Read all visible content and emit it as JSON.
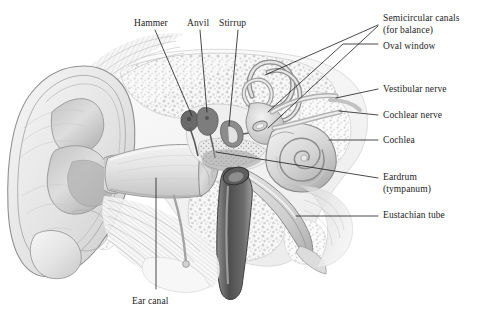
{
  "figure": {
    "background_color": "#ffffff",
    "line_color": "#1c1c1c",
    "text_color": "#1c1c1c",
    "ink_tones": {
      "outline": "#6e6e6e",
      "mid_gray": "#b9b9b9",
      "light_gray": "#dcdcdc",
      "very_light": "#f0f0f0",
      "dark_gray": "#555555",
      "darkest": "#3a3a3a"
    }
  },
  "labels": {
    "top": [
      {
        "id": "hammer",
        "text": "Hammer",
        "x": 134,
        "y": 18
      },
      {
        "id": "anvil",
        "text": "Anvil",
        "x": 187,
        "y": 18
      },
      {
        "id": "stirrup",
        "text": "Stirrup",
        "x": 219,
        "y": 18
      }
    ],
    "right": [
      {
        "id": "semicircular-canals",
        "text": "Semicircular canals\n(for balance)",
        "x": 383,
        "y": 13
      },
      {
        "id": "oval-window",
        "text": "Oval window",
        "x": 383,
        "y": 41
      },
      {
        "id": "vestibular-nerve",
        "text": "Vestibular nerve",
        "x": 383,
        "y": 84
      },
      {
        "id": "cochlear-nerve",
        "text": "Cochlear nerve",
        "x": 383,
        "y": 110
      },
      {
        "id": "cochlea",
        "text": "Cochlea",
        "x": 383,
        "y": 135
      },
      {
        "id": "eardrum",
        "text": "Eardrum\n(tympanum)",
        "x": 383,
        "y": 172
      },
      {
        "id": "eustachian-tube",
        "text": "Eustachian tube",
        "x": 383,
        "y": 210
      }
    ],
    "bottom": [
      {
        "id": "ear-canal",
        "text": "Ear canal",
        "x": 132,
        "y": 296
      }
    ]
  },
  "leaders": [
    {
      "id": "leader-hammer",
      "points": "155,30 192,116"
    },
    {
      "id": "leader-anvil",
      "points": "200,30 207,112"
    },
    {
      "id": "leader-stirrup",
      "points": "238,30 229,126"
    },
    {
      "id": "leader-semicircular-1",
      "points": "378,25 265,75"
    },
    {
      "id": "leader-semicircular-2",
      "points": "378,26 268,128"
    },
    {
      "id": "leader-oval-window",
      "points": "378,44 343,44 268,112"
    },
    {
      "id": "leader-vestibular-nerve",
      "points": "378,89 336,98"
    },
    {
      "id": "leader-cochlear-nerve",
      "points": "378,115 339,111"
    },
    {
      "id": "leader-cochlea",
      "points": "378,140 329,140"
    },
    {
      "id": "leader-eardrum",
      "points": "378,178 216,152"
    },
    {
      "id": "leader-eustachian-tube",
      "points": "378,216 296,216"
    },
    {
      "id": "leader-ear-canal",
      "points": "156,178 156,289"
    }
  ]
}
